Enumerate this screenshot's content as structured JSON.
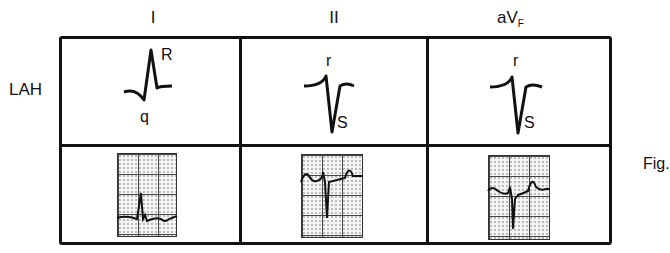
{
  "figure": {
    "lead_headers": [
      "I",
      "II",
      "aV",
      "F"
    ],
    "row_label": "LAH",
    "caption_fragment": "Fig.",
    "schematic_labels": {
      "lead_I": {
        "upper": "R",
        "lower": "q"
      },
      "lead_II": {
        "upper": "r",
        "lower": "S"
      },
      "lead_aVF": {
        "upper": "r",
        "lower": "S"
      }
    }
  }
}
